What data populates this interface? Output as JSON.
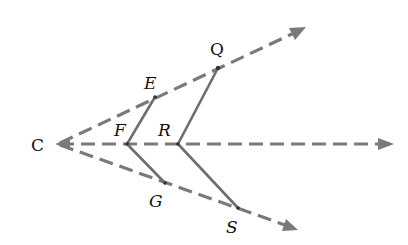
{
  "diagram": {
    "type": "geometry-rays",
    "vertex": {
      "label": "C",
      "x": 57,
      "y": 144
    },
    "rays": [
      {
        "name": "upper-ray",
        "from": [
          57,
          144
        ],
        "to": [
          306,
          27
        ]
      },
      {
        "name": "middle-ray",
        "from": [
          57,
          144
        ],
        "to": [
          394,
          144
        ]
      },
      {
        "name": "lower-ray",
        "from": [
          57,
          144
        ],
        "to": [
          298,
          230
        ]
      }
    ],
    "points": {
      "E": {
        "label": "E",
        "x": 155,
        "y": 97
      },
      "F": {
        "label": "F",
        "x": 127,
        "y": 144
      },
      "G": {
        "label": "G",
        "x": 165,
        "y": 183
      },
      "Q": {
        "label": "Q",
        "x": 218,
        "y": 68
      },
      "R": {
        "label": "R",
        "x": 178,
        "y": 144
      },
      "S": {
        "label": "S",
        "x": 238,
        "y": 208
      }
    },
    "segments": [
      {
        "name": "segment-EF",
        "points": [
          "E",
          "F"
        ]
      },
      {
        "name": "segment-FG",
        "points": [
          "F",
          "G"
        ]
      },
      {
        "name": "segment-QR",
        "points": [
          "Q",
          "R"
        ]
      },
      {
        "name": "segment-RS",
        "points": [
          "R",
          "S"
        ]
      }
    ],
    "labels": {
      "C": "C",
      "E": "E",
      "F": "F",
      "G": "G",
      "Q": "Q",
      "R": "R",
      "S": "S"
    },
    "colors": {
      "ray": "#7a7a7a",
      "segment": "#6e6e6e",
      "text": "#111111"
    }
  }
}
